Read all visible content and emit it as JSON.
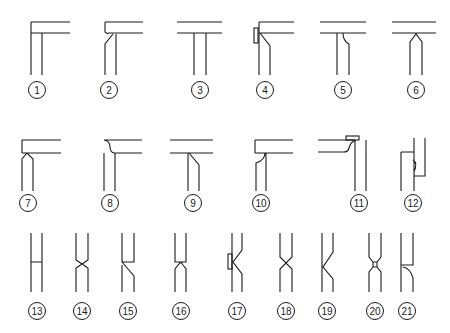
{
  "diagram": {
    "type": "joint-type-catalog",
    "labels": [
      "1",
      "2",
      "3",
      "4",
      "5",
      "6",
      "7",
      "8",
      "9",
      "10",
      "11",
      "12",
      "13",
      "14",
      "15",
      "16",
      "17",
      "18",
      "19",
      "20",
      "21"
    ],
    "rows": [
      {
        "name": "corner-and-tee-joints",
        "items": [
          "1",
          "2",
          "3",
          "4",
          "5",
          "6"
        ]
      },
      {
        "name": "corner-and-tee-joints-row-2",
        "items": [
          "7",
          "8",
          "9",
          "10",
          "11",
          "12"
        ]
      },
      {
        "name": "butt-joints",
        "items": [
          "13",
          "14",
          "15",
          "16",
          "17",
          "18",
          "19",
          "20",
          "21"
        ]
      }
    ],
    "line_color": "#1a1a1a",
    "background": "#ffffff"
  }
}
